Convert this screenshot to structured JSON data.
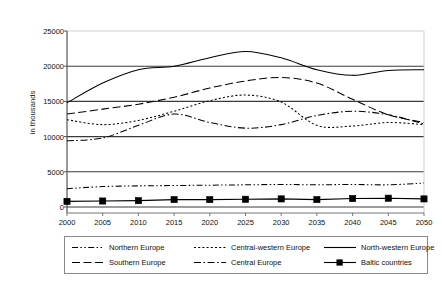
{
  "chart_data": {
    "type": "line",
    "title": "",
    "xlabel": "",
    "ylabel": "in thousands",
    "x": [
      2000,
      2005,
      2010,
      2015,
      2020,
      2025,
      2030,
      2035,
      2040,
      2045,
      2050
    ],
    "xtick_labels": [
      "2000",
      "2005",
      "2010",
      "2015",
      "2020",
      "2025",
      "2030",
      "2035",
      "2040",
      "2045",
      "2050"
    ],
    "ytick_labels": [
      "0",
      "5000",
      "10000",
      "15000",
      "20000",
      "25000"
    ],
    "yticks": [
      0,
      5000,
      10000,
      15000,
      20000,
      25000
    ],
    "ylim": [
      0,
      25000
    ],
    "xlim": [
      2000,
      2050
    ],
    "grid": "horizontal",
    "legend_position": "bottom",
    "series": [
      {
        "name": "Northern Europe",
        "style": "dash-dot-dot",
        "marker": "none",
        "values": [
          2600,
          2900,
          3000,
          3050,
          3100,
          3150,
          3200,
          3150,
          3200,
          3150,
          3400
        ]
      },
      {
        "name": "Southern Europe",
        "style": "long-dash",
        "marker": "none",
        "values": [
          13200,
          13900,
          14600,
          15600,
          16900,
          17900,
          18400,
          17600,
          15300,
          13100,
          12000
        ]
      },
      {
        "name": "Central-western Europe",
        "style": "dotted",
        "marker": "none",
        "values": [
          12400,
          11700,
          12300,
          13600,
          15100,
          15900,
          14900,
          11600,
          11500,
          12000,
          11700
        ]
      },
      {
        "name": "Central Europe",
        "style": "dash-dot",
        "marker": "none",
        "values": [
          9400,
          9800,
          11600,
          13200,
          12000,
          11200,
          11700,
          13000,
          13600,
          13100,
          11800
        ]
      },
      {
        "name": "North-western Europe",
        "style": "solid",
        "marker": "none",
        "values": [
          14800,
          17600,
          19500,
          20000,
          21200,
          22100,
          21200,
          19500,
          18700,
          19400,
          19500
        ]
      },
      {
        "name": "Baltic countries",
        "style": "solid-marker",
        "marker": "square",
        "values": [
          800,
          850,
          900,
          1050,
          1050,
          1100,
          1150,
          1050,
          1200,
          1250,
          1150
        ]
      }
    ]
  },
  "axis": {
    "y_title": "in thousands"
  },
  "legend": {
    "entries": [
      {
        "label": "Northern Europe",
        "key": "dash-dot-dot"
      },
      {
        "label": "Central-western Europe",
        "key": "dotted"
      },
      {
        "label": "North-western Europe",
        "key": "solid"
      },
      {
        "label": "Southern Europe",
        "key": "long-dash"
      },
      {
        "label": "Central Europe",
        "key": "dash-dot"
      },
      {
        "label": "Baltic countries",
        "key": "solid-marker"
      }
    ]
  },
  "colors": {
    "line": "#000000",
    "grid": "#3a3a3a",
    "axis": "#555555",
    "text": "#111111",
    "background": "#ffffff"
  }
}
